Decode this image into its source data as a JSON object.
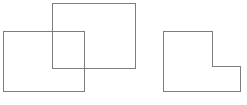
{
  "figure": {
    "background_color": "#ffffff",
    "stroke_color": "#7d7d7d",
    "stroke_width": 1,
    "canvas": {
      "width": 247,
      "height": 105
    },
    "groups": [
      {
        "name": "overlapping-rectangles",
        "label": "Two overlapping rectangles",
        "shapes": [
          {
            "name": "lower-left-rectangle",
            "label": "Lower left rectangle",
            "type": "rect",
            "x": 3,
            "y": 31,
            "width": 81,
            "height": 60,
            "stroke_color": "#7d7d7d",
            "fill": "none"
          },
          {
            "name": "upper-right-rectangle",
            "label": "Upper right rectangle",
            "type": "rect",
            "x": 52,
            "y": 3,
            "width": 83,
            "height": 65,
            "stroke_color": "#7d7d7d",
            "fill": "none"
          }
        ],
        "overlap_region": {
          "name": "intersection-region",
          "label": "Intersection of the two rectangles",
          "x": 52,
          "y": 31,
          "width": 32,
          "height": 37
        }
      },
      {
        "name": "l-shaped-polygon",
        "label": "L-shaped polygon",
        "shapes": [
          {
            "name": "l-shape",
            "label": "L shape",
            "type": "polygon",
            "points": "163,31 212,31 212,66 240,66 240,91 163,91",
            "vertices": [
              {
                "x": 163,
                "y": 31
              },
              {
                "x": 212,
                "y": 31
              },
              {
                "x": 212,
                "y": 66
              },
              {
                "x": 240,
                "y": 66
              },
              {
                "x": 240,
                "y": 91
              },
              {
                "x": 163,
                "y": 91
              }
            ],
            "stroke_color": "#7d7d7d",
            "fill": "none"
          }
        ]
      }
    ]
  }
}
